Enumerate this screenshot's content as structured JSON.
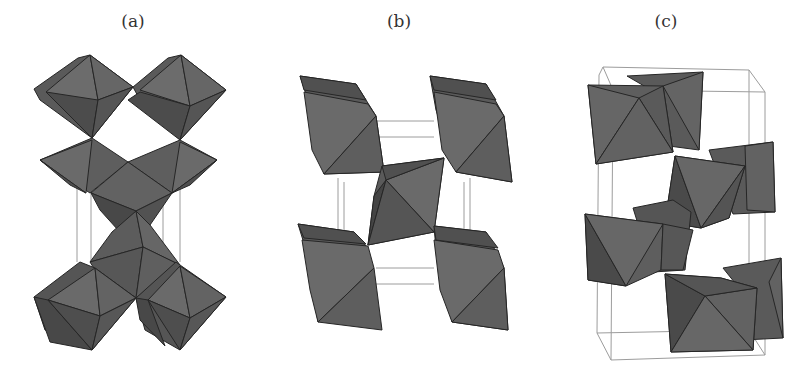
{
  "figure": {
    "panels": [
      {
        "id": "a",
        "label": "(a)"
      },
      {
        "id": "b",
        "label": "(b)"
      },
      {
        "id": "c",
        "label": "(c)"
      }
    ],
    "colors": {
      "face_light": "#6c6c6c",
      "face_mid": "#5c5c5c",
      "face_dark": "#4a4a4a",
      "edge": "#262626",
      "cell_line": "#9c9c9c"
    }
  }
}
